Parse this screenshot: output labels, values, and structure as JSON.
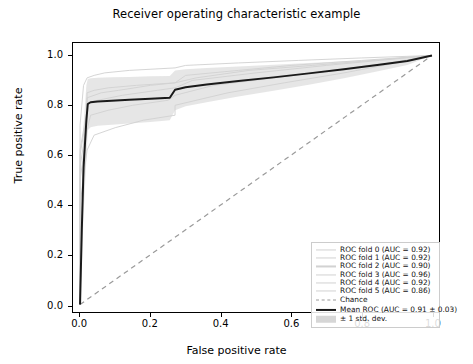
{
  "chart_data": {
    "type": "line",
    "title": "Receiver operating characteristic example",
    "xlabel": "False positive rate",
    "ylabel": "True positive rate",
    "xlim": [
      -0.02,
      1.02
    ],
    "ylim": [
      -0.03,
      1.05
    ],
    "xticks": [
      "0.0",
      "0.2",
      "0.4",
      "0.6",
      "0.8",
      "1.0"
    ],
    "yticks": [
      "0.0",
      "0.2",
      "0.4",
      "0.6",
      "0.8",
      "1.0"
    ],
    "xtick_values": [
      0.0,
      0.2,
      0.4,
      0.6,
      0.8,
      1.0
    ],
    "ytick_values": [
      0.0,
      0.2,
      0.4,
      0.6,
      0.8,
      1.0
    ],
    "grid": false,
    "legend_position": "lower right",
    "series": [
      {
        "name": "ROC fold 0 (AUC = 0.92)",
        "auc": 0.92,
        "color": "#d2d2d2",
        "style": "solid",
        "x": [
          0.0,
          0.0,
          0.02,
          0.02,
          0.04,
          0.08,
          0.16,
          0.27,
          0.3,
          0.45,
          0.6,
          0.8,
          1.0
        ],
        "y": [
          0.0,
          0.62,
          0.78,
          0.85,
          0.86,
          0.87,
          0.88,
          0.89,
          0.92,
          0.94,
          0.96,
          0.98,
          1.0
        ]
      },
      {
        "name": "ROC fold 1 (AUC = 0.92)",
        "auc": 0.92,
        "color": "#d2d2d2",
        "style": "solid",
        "x": [
          0.0,
          0.0,
          0.02,
          0.02,
          0.05,
          0.12,
          0.22,
          0.27,
          0.32,
          0.5,
          0.7,
          0.85,
          1.0
        ],
        "y": [
          0.0,
          0.55,
          0.74,
          0.81,
          0.82,
          0.84,
          0.86,
          0.87,
          0.9,
          0.93,
          0.96,
          0.98,
          1.0
        ]
      },
      {
        "name": "ROC fold 2 (AUC = 0.90)",
        "auc": 0.9,
        "color": "#d2d2d2",
        "style": "solid",
        "x": [
          0.0,
          0.0,
          0.02,
          0.03,
          0.08,
          0.15,
          0.25,
          0.27,
          0.38,
          0.55,
          0.72,
          0.88,
          1.0
        ],
        "y": [
          0.0,
          0.5,
          0.7,
          0.76,
          0.78,
          0.8,
          0.82,
          0.84,
          0.88,
          0.91,
          0.94,
          0.97,
          1.0
        ]
      },
      {
        "name": "ROC fold 3 (AUC = 0.96)",
        "auc": 0.96,
        "color": "#d2d2d2",
        "style": "solid",
        "x": [
          0.0,
          0.0,
          0.01,
          0.02,
          0.04,
          0.07,
          0.14,
          0.27,
          0.3,
          0.45,
          0.62,
          0.8,
          1.0
        ],
        "y": [
          0.0,
          0.72,
          0.88,
          0.91,
          0.92,
          0.93,
          0.94,
          0.95,
          0.96,
          0.97,
          0.98,
          0.99,
          1.0
        ]
      },
      {
        "name": "ROC fold 4 (AUC = 0.92)",
        "auc": 0.92,
        "color": "#d2d2d2",
        "style": "solid",
        "x": [
          0.0,
          0.0,
          0.02,
          0.02,
          0.06,
          0.11,
          0.2,
          0.27,
          0.33,
          0.48,
          0.66,
          0.83,
          1.0
        ],
        "y": [
          0.0,
          0.6,
          0.77,
          0.83,
          0.85,
          0.86,
          0.88,
          0.89,
          0.91,
          0.94,
          0.96,
          0.98,
          1.0
        ]
      },
      {
        "name": "ROC fold 5 (AUC = 0.86)",
        "auc": 0.86,
        "color": "#d2d2d2",
        "style": "solid",
        "x": [
          0.0,
          0.0,
          0.02,
          0.04,
          0.1,
          0.18,
          0.27,
          0.27,
          0.42,
          0.58,
          0.75,
          0.9,
          1.0
        ],
        "y": [
          0.0,
          0.4,
          0.62,
          0.68,
          0.71,
          0.74,
          0.76,
          0.8,
          0.85,
          0.89,
          0.93,
          0.97,
          1.0
        ]
      }
    ],
    "chance_line": {
      "name": "Chance",
      "color": "#9a9a9a",
      "style": "dashed",
      "x": [
        0.0,
        1.0
      ],
      "y": [
        0.0,
        1.0
      ]
    },
    "mean_roc": {
      "name": "Mean ROC (AUC = 0.91 $\\pm$ 0.03)",
      "auc": 0.91,
      "auc_std": 0.03,
      "color": "#1a1a1a",
      "style": "solid",
      "x": [
        0.0,
        0.005,
        0.01,
        0.018,
        0.022,
        0.03,
        0.05,
        0.09,
        0.14,
        0.2,
        0.255,
        0.27,
        0.3,
        0.36,
        0.45,
        0.55,
        0.65,
        0.75,
        0.85,
        0.93,
        1.0
      ],
      "y": [
        0.0,
        0.3,
        0.55,
        0.74,
        0.805,
        0.812,
        0.815,
        0.818,
        0.822,
        0.826,
        0.83,
        0.862,
        0.872,
        0.883,
        0.897,
        0.912,
        0.928,
        0.945,
        0.963,
        0.978,
        1.0
      ]
    },
    "std_band": {
      "name": "$\\pm$ 1 std. dev.",
      "color": "#d6d6d6",
      "x": [
        0.0,
        0.005,
        0.01,
        0.018,
        0.022,
        0.03,
        0.05,
        0.09,
        0.14,
        0.2,
        0.255,
        0.27,
        0.3,
        0.36,
        0.45,
        0.55,
        0.65,
        0.75,
        0.85,
        0.93,
        1.0
      ],
      "upper": [
        0.0,
        0.46,
        0.72,
        0.88,
        0.905,
        0.908,
        0.91,
        0.912,
        0.914,
        0.916,
        0.918,
        0.94,
        0.945,
        0.95,
        0.956,
        0.963,
        0.97,
        0.977,
        0.984,
        0.991,
        1.0
      ],
      "lower": [
        0.0,
        0.15,
        0.36,
        0.58,
        0.7,
        0.712,
        0.718,
        0.722,
        0.727,
        0.733,
        0.74,
        0.78,
        0.796,
        0.812,
        0.835,
        0.858,
        0.882,
        0.908,
        0.938,
        0.962,
        1.0
      ]
    },
    "legend_entries": [
      {
        "label": "ROC fold 0 (AUC = 0.92)",
        "marker": "fold"
      },
      {
        "label": "ROC fold 1 (AUC = 0.92)",
        "marker": "fold"
      },
      {
        "label": "ROC fold 2 (AUC = 0.90)",
        "marker": "fold"
      },
      {
        "label": "ROC fold 3 (AUC = 0.96)",
        "marker": "fold"
      },
      {
        "label": "ROC fold 4 (AUC = 0.92)",
        "marker": "fold"
      },
      {
        "label": "ROC fold 5 (AUC = 0.86)",
        "marker": "fold"
      },
      {
        "label": "Chance",
        "marker": "chance"
      },
      {
        "label": "Mean ROC (AUC = 0.91 ± 0.03)",
        "marker": "mean"
      },
      {
        "label": "± 1 std. dev.",
        "marker": "band"
      }
    ]
  }
}
